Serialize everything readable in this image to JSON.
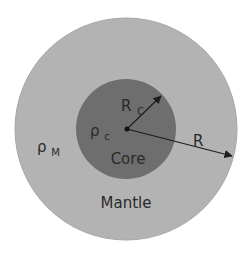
{
  "diagram": {
    "title": "",
    "colors": {
      "background": "#ffffff",
      "mantle_fill": "#b3b3b3",
      "mantle_stroke": "#a6a6a6",
      "core_fill": "#6e6e6e",
      "arrow": "#1e1e1e",
      "text": "#2a2a2a"
    },
    "shapes": {
      "mantle": {
        "cx": 126,
        "cy": 129,
        "r": 111
      },
      "core": {
        "cx": 126,
        "cy": 129,
        "r": 50
      },
      "center_dot": {
        "cx": 127,
        "cy": 129,
        "r": 2.5
      }
    },
    "arrows": [
      {
        "name": "core-radius",
        "from": [
          127,
          129
        ],
        "to": [
          161,
          96
        ]
      },
      {
        "name": "planet-radius",
        "from": [
          127,
          129
        ],
        "to": [
          232,
          156
        ]
      }
    ],
    "labels": {
      "core_name": "Core",
      "mantle_name": "Mantle",
      "core_radius_symbol": "R",
      "core_radius_subscript": "C",
      "planet_radius_symbol": "R",
      "core_density_symbol": "ρ",
      "core_density_subscript": "c",
      "mantle_density_symbol": "ρ",
      "mantle_density_subscript": "M"
    }
  }
}
